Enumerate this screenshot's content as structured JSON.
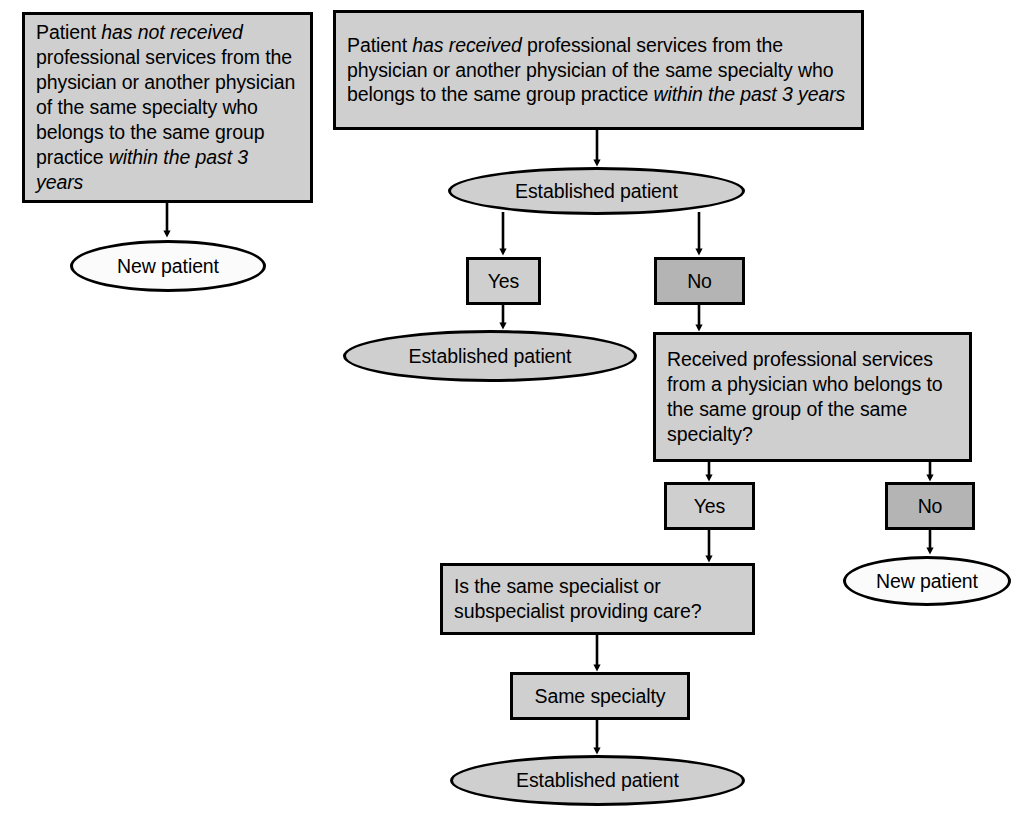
{
  "diagram": {
    "colors": {
      "node_fill": "#cfcfcf",
      "node_fill_dark": "#b4b4b4",
      "terminal_fill": "#fbfbfb",
      "stroke": "#000000",
      "background": "#ffffff"
    },
    "nodes": {
      "left_criteria": {
        "shape": "box",
        "text_plain": "Patient has not received professional services from the physician or another physician of the same specialty who belongs to the same group practice within the past 3 years",
        "text_html": "Patient <em>has not received</em> professional services from the physician or another physician of the same specialty who belongs to the same group practice <em>within the past 3 years</em>"
      },
      "left_outcome": {
        "shape": "ellipse",
        "text_plain": "New patient"
      },
      "right_criteria": {
        "shape": "box",
        "text_plain": "Patient has received professional services from the physician or another physician of the same specialty who belongs to the same group practice within the past 3 years",
        "text_html": "Patient <em>has received</em> professional services from the physician or another physician of the same specialty who belongs to the same group practice <em>within the past 3 years</em>"
      },
      "established_question": {
        "shape": "ellipse",
        "text_plain": "Established patient"
      },
      "established_yes": {
        "shape": "box",
        "text_plain": "Yes"
      },
      "established_no": {
        "shape": "box",
        "text_plain": "No"
      },
      "established_yes_outcome": {
        "shape": "ellipse",
        "text_plain": "Established patient"
      },
      "same_group_question": {
        "shape": "box",
        "text_plain": "Received professional services from a physician who belongs to the same group of the same specialty?"
      },
      "same_group_yes": {
        "shape": "box",
        "text_plain": "Yes"
      },
      "same_group_no": {
        "shape": "box",
        "text_plain": "No"
      },
      "same_group_no_outcome": {
        "shape": "ellipse",
        "text_plain": "New patient"
      },
      "specialist_question": {
        "shape": "box",
        "text_plain": "Is the same specialist or subspecialist providing care?"
      },
      "same_specialty": {
        "shape": "box",
        "text_plain": "Same specialty"
      },
      "final_outcome": {
        "shape": "ellipse",
        "text_plain": "Established patient"
      }
    },
    "edges": [
      {
        "from": "left_criteria",
        "to": "left_outcome"
      },
      {
        "from": "right_criteria",
        "to": "established_question"
      },
      {
        "from": "established_question",
        "to": "established_yes"
      },
      {
        "from": "established_question",
        "to": "established_no"
      },
      {
        "from": "established_yes",
        "to": "established_yes_outcome"
      },
      {
        "from": "established_no",
        "to": "same_group_question"
      },
      {
        "from": "same_group_question",
        "to": "same_group_yes"
      },
      {
        "from": "same_group_question",
        "to": "same_group_no"
      },
      {
        "from": "same_group_no",
        "to": "same_group_no_outcome"
      },
      {
        "from": "same_group_yes",
        "to": "specialist_question"
      },
      {
        "from": "specialist_question",
        "to": "same_specialty"
      },
      {
        "from": "same_specialty",
        "to": "final_outcome"
      }
    ]
  }
}
